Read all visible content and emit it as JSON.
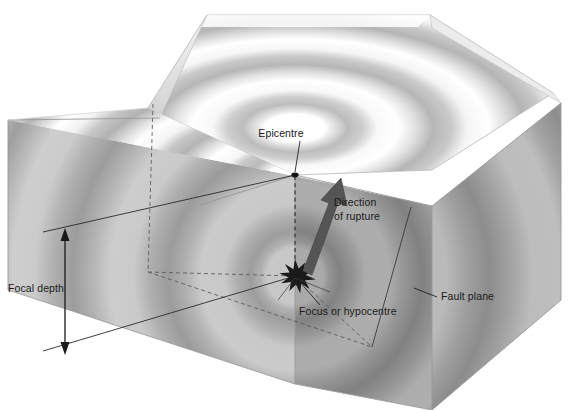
{
  "figure": {
    "type": "geological-block-diagram"
  },
  "labels": {
    "epicentre": "Epicentre",
    "direction_line1": "Direction",
    "direction_line2": "of rupture",
    "focus": "Focus or hypocentre",
    "fault_plane": "Fault plane",
    "focal_depth": "Focal depth"
  },
  "colors": {
    "background": "#ffffff",
    "ink": "#1a1a1a",
    "arrow_fill": "#4a4a4a",
    "top_face_light": "#ffffff",
    "top_face_band": "#bdbdbd",
    "front_face_light": "#c8c8c8",
    "front_face_band": "#9a9a9a",
    "right_face_light": "#b4b4b4",
    "right_face_band": "#8a8a8a",
    "left_face_light": "#d8d8d8",
    "left_face_band": "#b0b0b0",
    "dashed_line": "#555555",
    "edge_line": "#8f8f8f"
  },
  "annotations": [
    {
      "name": "epicentre",
      "text": "Epicentre",
      "x": 281,
      "y": 135,
      "anchor": "middle",
      "leader": true
    },
    {
      "name": "direction-of-rupture",
      "text": "Direction of rupture",
      "x": 334,
      "y": 205,
      "anchor": "start",
      "leader": false
    },
    {
      "name": "focus-or-hypocentre",
      "text": "Focus or hypocentre",
      "x": 297,
      "y": 315,
      "anchor": "start",
      "leader": true
    },
    {
      "name": "fault-plane",
      "text": "Fault plane",
      "x": 440,
      "y": 299,
      "anchor": "start",
      "leader": true
    },
    {
      "name": "focal-depth",
      "text": "Focal depth",
      "x": 8,
      "y": 291,
      "anchor": "start",
      "leader": false
    }
  ],
  "features": {
    "epicentre_point": {
      "x": 295,
      "y": 175
    },
    "focus_point": {
      "x": 295,
      "y": 276
    },
    "rupture_arrow": {
      "from_x": 305,
      "from_y": 270,
      "to_x": 339,
      "to_y": 181
    },
    "focal_depth_arrow": {
      "x": 65,
      "y_top": 232,
      "y_bottom": 351
    }
  }
}
